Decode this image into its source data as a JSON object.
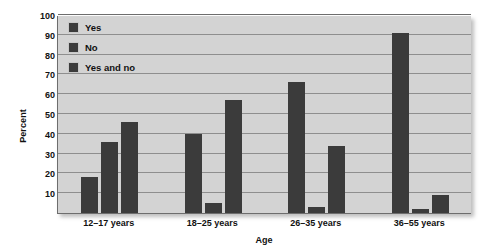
{
  "chart_data": {
    "type": "bar",
    "title": "",
    "xlabel": "Age",
    "ylabel": "Percent",
    "categories": [
      "12–17 years",
      "18–25 years",
      "26–35 years",
      "36–55 years"
    ],
    "series": [
      {
        "name": "Yes",
        "values": [
          18,
          40,
          66,
          91
        ]
      },
      {
        "name": "No",
        "values": [
          36,
          5,
          3,
          2
        ]
      },
      {
        "name": "Yes and no",
        "values": [
          46,
          57,
          34,
          9
        ]
      }
    ],
    "ylim": [
      0,
      100
    ],
    "yticks": [
      10,
      20,
      30,
      40,
      50,
      60,
      70,
      80,
      90,
      100
    ],
    "grid": true,
    "legend_position": "top-left-inside",
    "bar_color": "#3b3b3b",
    "plot_background": "#d3d3d3",
    "gridline_color": "#8e8e8e",
    "axis_color": "#6d6d6d"
  }
}
